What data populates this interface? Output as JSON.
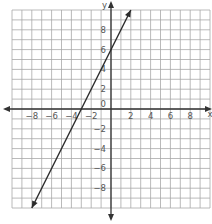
{
  "chart_data": {
    "type": "line",
    "title": "",
    "xlabel": "x",
    "ylabel": "y",
    "xlim": [
      -10,
      10
    ],
    "ylim": [
      -10,
      10
    ],
    "grid": true,
    "x_ticks": [
      -8,
      -6,
      -4,
      -2,
      2,
      4,
      6,
      8
    ],
    "y_ticks": [
      8,
      6,
      4,
      2,
      -2,
      -4,
      -6,
      -8
    ],
    "origin_label": "0",
    "series": [
      {
        "name": "line",
        "equation": "y = 2x + 6",
        "x": [
          -8,
          2
        ],
        "y": [
          -10,
          10
        ],
        "arrows": "both"
      }
    ]
  },
  "colors": {
    "grid": "#a8a8a8",
    "axis": "#333333",
    "line": "#2a2a2a",
    "label": "#555555"
  }
}
